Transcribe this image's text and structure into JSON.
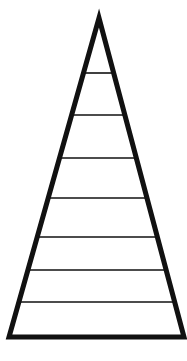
{
  "diagram": {
    "type": "pyramid",
    "levels": 8,
    "background": "#ffffff",
    "stroke_color": "#111111",
    "outline": {
      "apex": [
        99,
        18
      ],
      "base_left": [
        9,
        337
      ],
      "base_right": [
        184,
        337
      ],
      "stroke_width": 5
    },
    "divider_lines_y": [
      73,
      115,
      158,
      198,
      237,
      270,
      302
    ],
    "divider_stroke_width": 1.6
  }
}
